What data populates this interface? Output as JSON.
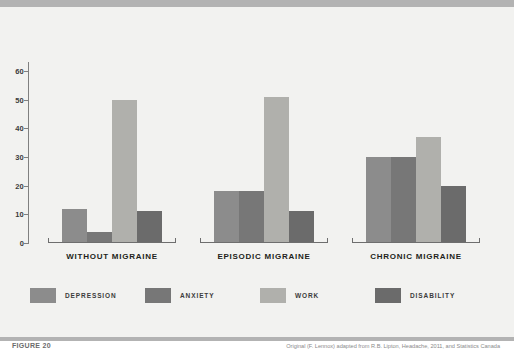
{
  "figure": {
    "number_label": "FIGURE 20",
    "credit": "Original (F. Lennox) adapted from R.B. Lipton, Headache, 2011, and Statistics Canada"
  },
  "chart_data": {
    "type": "bar",
    "title": "",
    "subtitle": "",
    "xlabel": "",
    "ylabel": "",
    "ylim": [
      0,
      60
    ],
    "yticks": [
      0,
      10,
      20,
      30,
      40,
      50,
      60
    ],
    "ytick_labels": [
      "0",
      "10",
      "20",
      "30",
      "40",
      "50",
      "60"
    ],
    "grid": false,
    "legend_position": "bottom",
    "categories": [
      "WITHOUT MIGRAINE",
      "EPISODIC MIGRAINE",
      "CHRONIC MIGRAINE"
    ],
    "series": [
      {
        "name": "DEPRESSION",
        "color": "#8c8c8c",
        "values": [
          12,
          18,
          30
        ]
      },
      {
        "name": "ANXIETY",
        "color": "#777777",
        "values": [
          4,
          18,
          30
        ]
      },
      {
        "name": "WORK",
        "color": "#b0b0ac",
        "values": [
          50,
          51,
          37
        ]
      },
      {
        "name": "DISABILITY",
        "color": "#6b6b6b",
        "values": [
          11,
          11,
          20
        ]
      }
    ]
  },
  "colors": {
    "page_background": "#ffffff",
    "panel_background": "#f2f2f0",
    "band": "#b3b3b3",
    "axis": "#808080",
    "label_text": "#231f20"
  }
}
